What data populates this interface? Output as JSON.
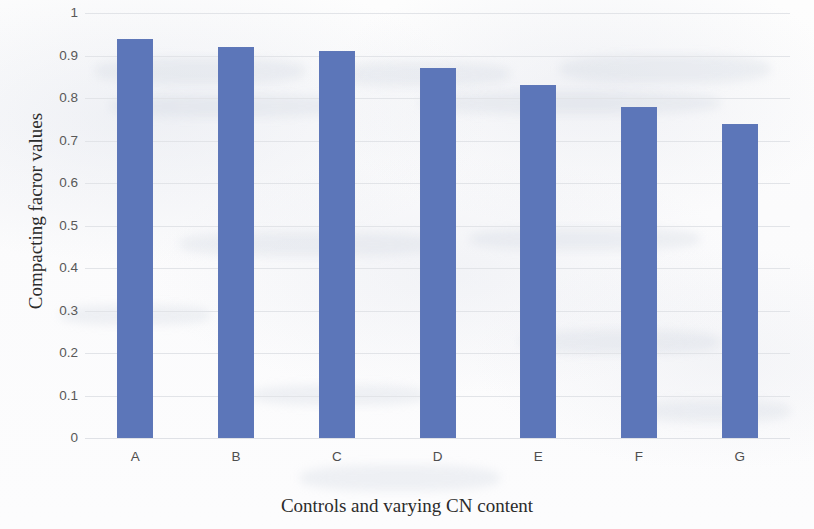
{
  "chart_data": {
    "type": "bar",
    "title": "",
    "categories": [
      "A",
      "B",
      "C",
      "D",
      "E",
      "F",
      "G"
    ],
    "values": [
      0.94,
      0.92,
      0.91,
      0.87,
      0.83,
      0.78,
      0.74
    ],
    "series": [
      {
        "name": "Compacting facror values",
        "values": [
          0.94,
          0.92,
          0.91,
          0.87,
          0.83,
          0.78,
          0.74
        ]
      }
    ],
    "xlabel": "Controls and varying CN content",
    "ylabel": "Compacting facror values",
    "ylim": [
      0,
      1
    ],
    "yticks": [
      "0",
      "0.1",
      "0.2",
      "0.3",
      "0.4",
      "0.5",
      "0.6",
      "0.7",
      "0.8",
      "0.9",
      "1"
    ],
    "ytick_values": [
      0,
      0.1,
      0.2,
      0.3,
      0.4,
      0.5,
      0.6,
      0.7,
      0.8,
      0.9,
      1
    ],
    "grid": true,
    "legend": false,
    "bar_color": "#5c76b9",
    "gridline_color": "#e2e4e8",
    "background_color": "#fdfdfd"
  }
}
